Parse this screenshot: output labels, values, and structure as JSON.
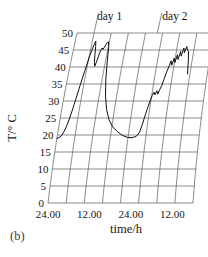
{
  "panel": {
    "label": "(b)"
  },
  "chart_data": {
    "type": "line",
    "title": "",
    "subtitle": "",
    "xlabel": "time/h",
    "ylabel": "T/° C",
    "ylim": [
      0,
      50
    ],
    "ytick_labels": [
      "0",
      "5",
      "10",
      "15",
      "20",
      "25",
      "30",
      "35",
      "40",
      "45",
      "50"
    ],
    "ytick_values": [
      0,
      5,
      10,
      15,
      20,
      25,
      30,
      35,
      40,
      45,
      50
    ],
    "xtick_labels": [
      "24.00",
      "12.00",
      "24.00",
      "12.00"
    ],
    "xtick_values": [
      0,
      12,
      24,
      36
    ],
    "xlim": [
      0,
      42
    ],
    "grid": true,
    "grid_style": "skewed-parallelogram",
    "n_vertical_gridlines": 8,
    "legend": null,
    "annotations": [
      {
        "text": "day 1",
        "x": 10,
        "position": "top"
      },
      {
        "text": "day 2",
        "x": 30,
        "position": "top"
      }
    ],
    "series": [
      {
        "name": "T",
        "units": "°C",
        "x": [
          0.0,
          0.6,
          1.2,
          1.8,
          2.4,
          3.0,
          3.6,
          4.2,
          4.8,
          5.4,
          6.0,
          6.3,
          6.6,
          6.9,
          7.2,
          7.5,
          7.8,
          8.1,
          8.4,
          8.7,
          9.0,
          9.3,
          9.6,
          9.9,
          10.2,
          10.6,
          11.0,
          11.6,
          12.4,
          13.4,
          14.6,
          16.0,
          17.6,
          19.2,
          20.8,
          22.2,
          23.4,
          24.2,
          24.8,
          25.2,
          25.6,
          26.0,
          26.4,
          26.8,
          27.2,
          27.6,
          28.0,
          28.4,
          28.8,
          29.2,
          29.6,
          30.0,
          30.4,
          30.8,
          31.2,
          31.6,
          32.0,
          32.4,
          32.8,
          33.2,
          33.6,
          34.0,
          34.4,
          34.8,
          35.2,
          35.6,
          36.0
        ],
        "y": [
          19.0,
          19.2,
          19.8,
          21.0,
          23.0,
          26.0,
          30.0,
          34.5,
          39.0,
          43.5,
          46.5,
          47.6,
          46.0,
          43.5,
          41.3,
          40.2,
          41.5,
          43.5,
          45.0,
          45.6,
          45.2,
          45.8,
          46.6,
          47.2,
          47.4,
          46.0,
          42.0,
          36.5,
          31.5,
          27.5,
          24.5,
          22.4,
          21.0,
          19.9,
          19.3,
          19.2,
          19.6,
          20.8,
          23.5,
          26.0,
          28.0,
          30.0,
          31.6,
          32.6,
          31.8,
          33.0,
          32.0,
          33.4,
          34.5,
          36.5,
          38.5,
          40.0,
          41.8,
          40.5,
          42.6,
          41.3,
          43.6,
          42.2,
          44.6,
          43.2,
          45.6,
          44.2,
          46.0,
          45.0,
          44.6,
          42.0,
          38.0
        ]
      }
    ]
  }
}
